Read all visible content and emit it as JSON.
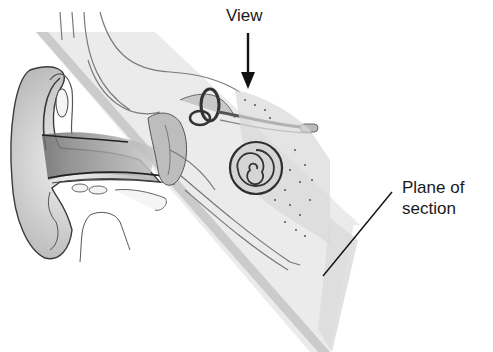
{
  "diagram": {
    "labels": {
      "view": "View",
      "plane_line1": "Plane of",
      "plane_line2": "section"
    },
    "annotations": [
      {
        "type": "arrow",
        "target": "view",
        "direction": "down"
      },
      {
        "type": "leader-line",
        "target": "plane-of-section"
      }
    ],
    "parts_depicted": [
      "outer-ear",
      "ear-canal",
      "semicircular-canals",
      "cochlea",
      "section-plane"
    ],
    "colors": {
      "ink": "#1a1a1a",
      "plane": "#e6e6e6",
      "shade": "#9a9a9a"
    }
  }
}
